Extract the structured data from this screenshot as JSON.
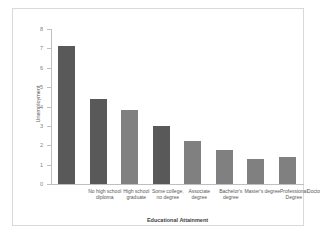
{
  "chart_data": {
    "type": "bar",
    "title": "",
    "xlabel": "Educational Attainment",
    "ylabel": "Unemployment",
    "categories": [
      "No high school diploma",
      "High school graduate",
      "Some college, no degree",
      "Associate degree",
      "Bachelor's degree",
      "Master's degree",
      "Professional Degree",
      "Doctoral Degree"
    ],
    "values": [
      7.1,
      4.4,
      3.8,
      3.0,
      2.2,
      1.75,
      1.3,
      1.4
    ],
    "colors": [
      "#595959",
      "#595959",
      "#808080",
      "#595959",
      "#808080",
      "#808080",
      "#808080",
      "#808080"
    ],
    "ylim": [
      0,
      8
    ],
    "yticks": [
      0,
      1,
      2,
      3,
      4,
      5,
      6,
      7,
      8
    ],
    "ytick_labels": [
      "0",
      "1",
      "2",
      "3",
      "4",
      "5",
      "6",
      "7",
      "8"
    ],
    "grid": false,
    "legend": false
  },
  "style": {
    "frame_border": "#d9d9d9",
    "axis_color": "#bfbfbf",
    "tick_text": "#7f7f7f",
    "label_text": "#595959",
    "background": "#ffffff"
  }
}
